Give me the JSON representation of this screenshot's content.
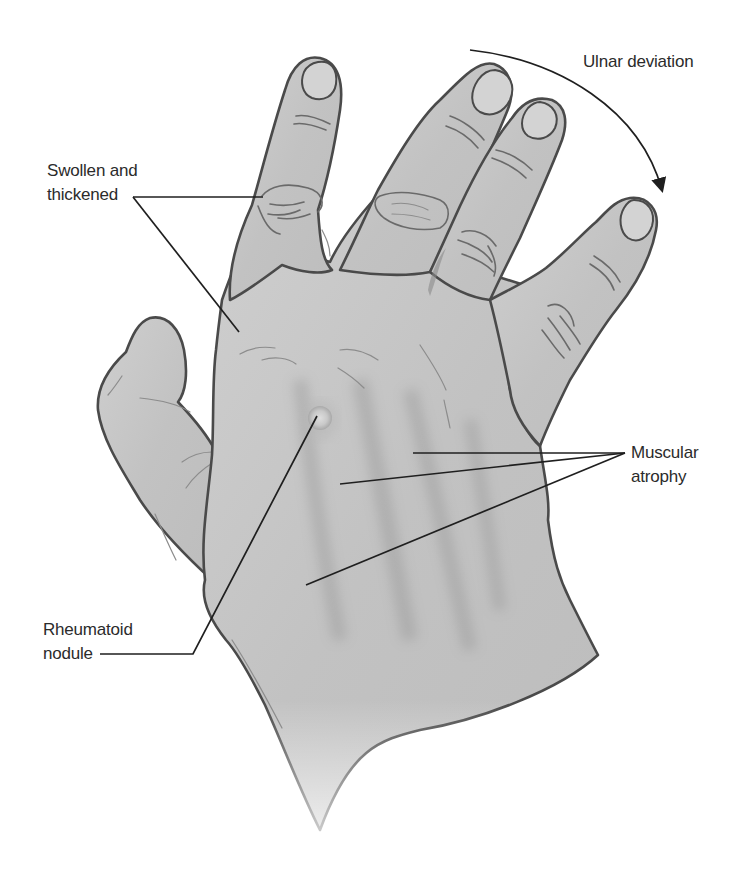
{
  "figure": {
    "background": "#ffffff",
    "skin_color": "#c4c4c4",
    "outline_color": "#4a4a4a",
    "leader_color": "#1f1f1f"
  },
  "labels": {
    "ulnar_deviation": {
      "text": "Ulnar deviation"
    },
    "swollen": {
      "line1": "Swollen and",
      "line2": "thickened"
    },
    "muscular": {
      "line1": "Muscular",
      "line2": "atrophy"
    },
    "nodule": {
      "line1": "Rheumatoid",
      "line2": "nodule"
    }
  }
}
